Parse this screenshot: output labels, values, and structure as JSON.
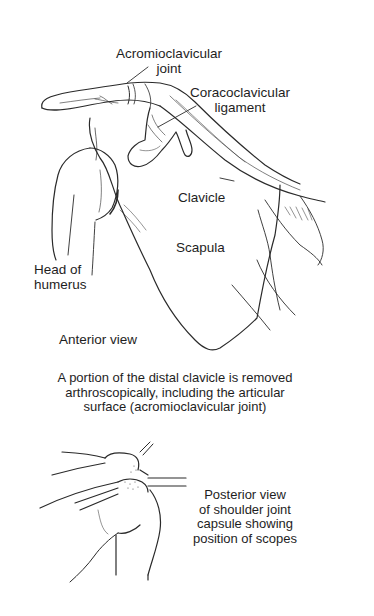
{
  "figure": {
    "anterior": {
      "labels": {
        "acromioclavicular_joint": [
          "Acromioclavicular",
          "joint"
        ],
        "coracoclavicular_ligament": [
          "Coracoclavicular",
          "ligament"
        ],
        "clavicle": "Clavicle",
        "scapula": "Scapula",
        "head_of_humerus": [
          "Head of",
          "humerus"
        ]
      },
      "view_label": "Anterior view"
    },
    "caption": [
      "A portion of the distal clavicle is removed",
      "arthroscopically, including the articular",
      "surface (acromioclavicular joint)"
    ],
    "posterior": {
      "caption": [
        "Posterior view",
        "of shoulder joint",
        "capsule showing",
        "position of scopes"
      ]
    },
    "colors": {
      "line": "#2a2a2a",
      "background": "#ffffff"
    }
  }
}
